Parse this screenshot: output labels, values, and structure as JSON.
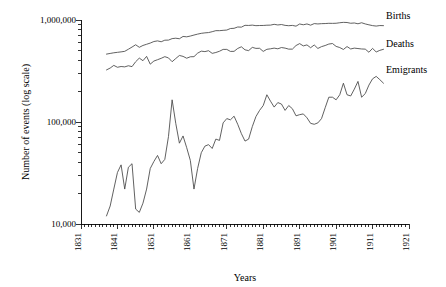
{
  "chart_data": {
    "type": "line",
    "title": "",
    "xlabel": "Years",
    "ylabel": "Number of events (log scale)",
    "yscale": "log",
    "xlim": [
      1831,
      1921
    ],
    "ylim": [
      10000,
      1000000
    ],
    "grid": false,
    "legend_position": "right-inline",
    "x_tick_labels": [
      "1831",
      "1841",
      "1851",
      "1861",
      "1871",
      "1881",
      "1891",
      "1901",
      "1911",
      "1921"
    ],
    "x_ticks": [
      1831,
      1841,
      1851,
      1861,
      1871,
      1881,
      1891,
      1901,
      1911,
      1921
    ],
    "y_tick_labels": [
      "10,000",
      "100,000",
      "1,000,000"
    ],
    "y_ticks": [
      10000,
      100000,
      1000000
    ],
    "minor_ticks": "log decade subdivisions on y, every year on x",
    "series": [
      {
        "name": "Births",
        "x": [
          1838,
          1839,
          1840,
          1841,
          1842,
          1843,
          1844,
          1845,
          1846,
          1847,
          1848,
          1849,
          1850,
          1851,
          1852,
          1853,
          1854,
          1855,
          1856,
          1857,
          1858,
          1859,
          1860,
          1861,
          1862,
          1863,
          1864,
          1865,
          1866,
          1867,
          1868,
          1869,
          1870,
          1871,
          1872,
          1873,
          1874,
          1875,
          1876,
          1877,
          1878,
          1879,
          1880,
          1881,
          1882,
          1883,
          1884,
          1885,
          1886,
          1887,
          1888,
          1889,
          1890,
          1891,
          1892,
          1893,
          1894,
          1895,
          1896,
          1897,
          1898,
          1899,
          1900,
          1901,
          1902,
          1903,
          1904,
          1905,
          1906,
          1907,
          1908,
          1909,
          1910,
          1911,
          1912,
          1913,
          1914
        ],
        "values": [
          463000,
          470000,
          477000,
          482000,
          487000,
          493000,
          517000,
          543000,
          572000,
          540000,
          563000,
          578000,
          594000,
          615000,
          624000,
          612000,
          634000,
          635000,
          657000,
          663000,
          655000,
          690000,
          684000,
          696000,
          712000,
          727000,
          740000,
          748000,
          753000,
          768000,
          786000,
          786000,
          792000,
          797000,
          825000,
          829000,
          854000,
          851000,
          887000,
          884000,
          891000,
          880000,
          883000,
          884000,
          889000,
          891000,
          907000,
          894000,
          903000,
          886000,
          879000,
          885000,
          870000,
          914000,
          898000,
          915000,
          890000,
          922000,
          915000,
          921000,
          923000,
          928000,
          927000,
          929000,
          940000,
          948000,
          945000,
          929000,
          935000,
          918000,
          940000,
          915000,
          897000,
          881000,
          872000,
          882000,
          880000
        ]
      },
      {
        "name": "Deaths",
        "x": [
          1838,
          1839,
          1840,
          1841,
          1842,
          1843,
          1844,
          1845,
          1846,
          1847,
          1848,
          1849,
          1850,
          1851,
          1852,
          1853,
          1854,
          1855,
          1856,
          1857,
          1858,
          1859,
          1860,
          1861,
          1862,
          1863,
          1864,
          1865,
          1866,
          1867,
          1868,
          1869,
          1870,
          1871,
          1872,
          1873,
          1874,
          1875,
          1876,
          1877,
          1878,
          1879,
          1880,
          1881,
          1882,
          1883,
          1884,
          1885,
          1886,
          1887,
          1888,
          1889,
          1890,
          1891,
          1892,
          1893,
          1894,
          1895,
          1896,
          1897,
          1898,
          1899,
          1900,
          1901,
          1902,
          1903,
          1904,
          1905,
          1906,
          1907,
          1908,
          1909,
          1910,
          1911,
          1912,
          1913,
          1914
        ],
        "values": [
          324000,
          338000,
          359000,
          344000,
          350000,
          347000,
          356000,
          349000,
          390000,
          423000,
          399000,
          440000,
          369000,
          396000,
          408000,
          421000,
          437000,
          425000,
          390000,
          419000,
          449000,
          440000,
          422000,
          436000,
          437000,
          473000,
          495000,
          490000,
          500000,
          471000,
          480000,
          494000,
          515000,
          515000,
          492000,
          493000,
          526000,
          546000,
          510000,
          501000,
          539000,
          527000,
          528000,
          492000,
          516000,
          522000,
          530000,
          522000,
          537000,
          530000,
          518000,
          518000,
          562000,
          587000,
          557000,
          570000,
          535000,
          569000,
          526000,
          548000,
          562000,
          581000,
          588000,
          551000,
          537000,
          514000,
          549000,
          520000,
          530000,
          525000,
          520000,
          518000,
          483000,
          527000,
          486000,
          504000,
          516000
        ]
      },
      {
        "name": "Emigrants",
        "x": [
          1838,
          1839,
          1840,
          1841,
          1842,
          1843,
          1844,
          1845,
          1846,
          1847,
          1848,
          1849,
          1850,
          1851,
          1852,
          1853,
          1854,
          1855,
          1856,
          1857,
          1858,
          1859,
          1860,
          1861,
          1862,
          1863,
          1864,
          1865,
          1866,
          1867,
          1868,
          1869,
          1870,
          1871,
          1872,
          1873,
          1874,
          1875,
          1876,
          1877,
          1878,
          1879,
          1880,
          1881,
          1882,
          1883,
          1884,
          1885,
          1886,
          1887,
          1888,
          1889,
          1890,
          1891,
          1892,
          1893,
          1894,
          1895,
          1896,
          1897,
          1898,
          1899,
          1900,
          1901,
          1902,
          1903,
          1904,
          1905,
          1906,
          1907,
          1908,
          1909,
          1910,
          1911,
          1912,
          1913,
          1914
        ],
        "values": [
          12000,
          15000,
          22000,
          32000,
          38000,
          22000,
          36000,
          39000,
          14000,
          13000,
          16000,
          22000,
          35000,
          41000,
          47000,
          39000,
          43000,
          72000,
          165000,
          97000,
          62000,
          73000,
          56000,
          42000,
          22000,
          35000,
          50000,
          58000,
          60000,
          55000,
          68000,
          66000,
          98000,
          108000,
          105000,
          114000,
          95000,
          77000,
          65000,
          68000,
          90000,
          113000,
          130000,
          145000,
          185000,
          160000,
          140000,
          155000,
          150000,
          130000,
          145000,
          135000,
          115000,
          118000,
          120000,
          110000,
          97000,
          95000,
          98000,
          108000,
          138000,
          175000,
          175000,
          165000,
          185000,
          240000,
          185000,
          180000,
          210000,
          250000,
          175000,
          190000,
          230000,
          265000,
          280000,
          260000,
          240000
        ]
      }
    ],
    "annotations": [
      {
        "text": "Births",
        "near_year": 1914,
        "near_value": 880000
      },
      {
        "text": "Deaths",
        "near_year": 1914,
        "near_value": 516000
      },
      {
        "text": "Emigrants",
        "near_year": 1914,
        "near_value": 240000
      }
    ]
  },
  "legend": {
    "births": "Births",
    "deaths": "Deaths",
    "emigrants": "Emigrants"
  },
  "axes": {
    "x_title": "Years",
    "y_title": "Number of events (log scale)",
    "y_labels": {
      "top": "1,000,000",
      "mid": "100,000",
      "bottom": "10,000"
    },
    "x_labels": {
      "t1": "1831",
      "t2": "1841",
      "t3": "1851",
      "t4": "1861",
      "t5": "1871",
      "t6": "1881",
      "t7": "1891",
      "t8": "1901",
      "t9": "1911",
      "t10": "1921"
    }
  },
  "style": {
    "line_color": "#444444",
    "axis_color": "#000000",
    "background": "#ffffff"
  }
}
